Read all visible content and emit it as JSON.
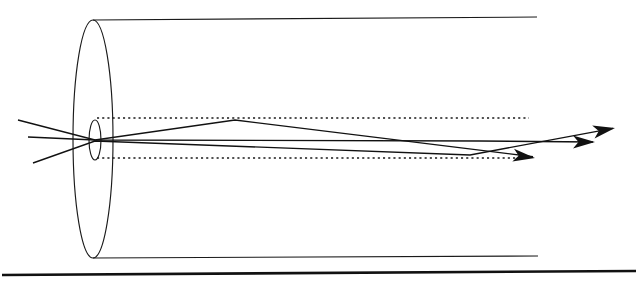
{
  "figure": {
    "title": "Optical ray trace through a lens inside a cylindrical barrel",
    "caption": "",
    "width": 637,
    "height": 283,
    "background_color": "#ffffff",
    "line_color": "#1a1a1a",
    "ray_color": "#111111"
  },
  "barrel": {
    "name": "cylindrical-barrel",
    "front_face_center_x": 93,
    "front_face_center_y": 139,
    "front_face_rx": 20,
    "front_face_ry": 119,
    "top_edge": {
      "x1": 93,
      "y1": 20,
      "x2": 537,
      "y2": 17
    },
    "bottom_edge": {
      "x1": 93,
      "y1": 258,
      "x2": 538,
      "y2": 256
    }
  },
  "lens": {
    "name": "biconvex-lens",
    "center_x": 95,
    "center_y": 140,
    "rx": 6,
    "ry": 20
  },
  "axes": {
    "optical_axis": {
      "x1": 28,
      "y1": 137,
      "x2": 637,
      "y2": 141
    },
    "upper_marginal_dotted": {
      "x1": 97,
      "y": 118,
      "x2": 529
    },
    "lower_marginal_dotted": {
      "x1": 97,
      "y": 158,
      "x2": 528
    }
  },
  "rays": [
    {
      "name": "ray-upper-incoming",
      "label": "ray 1",
      "points": "18,120 95,140 235,120 535,157"
    },
    {
      "name": "ray-lower-incoming",
      "label": "ray 2",
      "points": "33,163 95,141 470,155 615,128"
    },
    {
      "name": "ray-axial",
      "label": "ray 3 (axial)",
      "points": "28,137 95,140 480,141 595,142"
    }
  ],
  "arrows": [
    {
      "name": "arrow-ray-upper-exit",
      "tip_x": 615,
      "tip_y": 128,
      "angle_deg": -10.5
    },
    {
      "name": "arrow-ray-axial-exit",
      "tip_x": 595,
      "tip_y": 142,
      "angle_deg": 0
    },
    {
      "name": "arrow-ray-lower-exit",
      "tip_x": 535,
      "tip_y": 158,
      "angle_deg": 7.5
    }
  ],
  "page_rule": {
    "name": "bottom-horizontal-rule",
    "x1": 2,
    "y1": 275,
    "x2": 636,
    "y2": 271
  }
}
